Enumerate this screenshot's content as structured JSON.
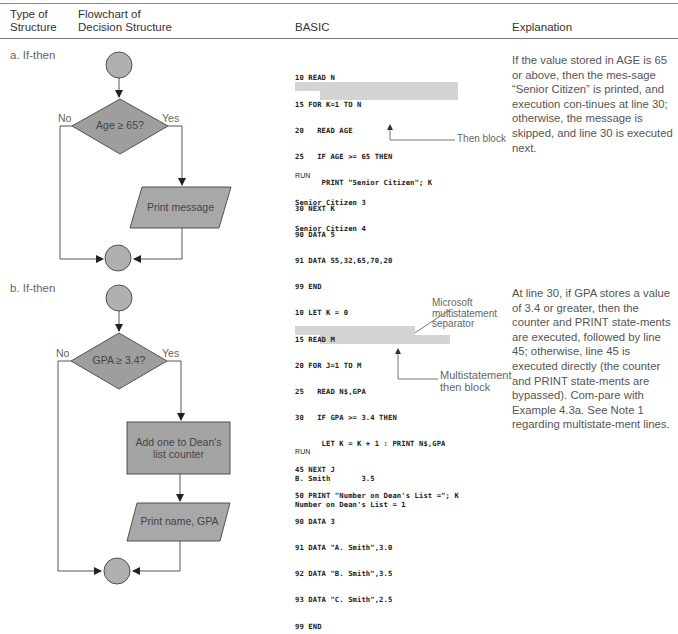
{
  "headers": {
    "type_of_structure": [
      "Type of",
      "Structure"
    ],
    "flowchart": [
      "Flowchart of",
      "Decision Structure"
    ],
    "basic": "BASIC",
    "explanation": "Explanation"
  },
  "examples": [
    {
      "label": "a.  If-then",
      "flowchart": {
        "decision": "Age ≥ 65?",
        "no": "No",
        "yes": "Yes",
        "io_box": "Print message"
      },
      "code": [
        "10 READ N",
        "15 FOR K=1 TO N",
        "20   READ AGE",
        "25   IF AGE >= 65 THEN",
        "      PRINT \"Senior Citizen\"; K",
        "30 NEXT K",
        "90 DATA 5",
        "91 DATA 55,32,65,70,20",
        "99 END"
      ],
      "annotations": [
        "Then block"
      ],
      "run": [
        "RUN",
        "Senior Citizen 3",
        "Senior Citizen 4"
      ],
      "explanation": "If the value stored in AGE is 65 or above, then the mes-sage “Senior Citizen” is printed, and execution con-tinues at line 30; otherwise, the message is skipped, and line 30 is executed next."
    },
    {
      "label": "b.  If-then",
      "flowchart": {
        "decision": "GPA ≥ 3.4?",
        "no": "No",
        "yes": "Yes",
        "process_box": [
          "Add one to Dean's",
          "list counter"
        ],
        "io_box": "Print name, GPA"
      },
      "code": [
        "10 LET K = 0",
        "15 READ M",
        "20 FOR J=1 TO M",
        "25   READ N$,GPA",
        "30   IF GPA >= 3.4 THEN",
        "      LET K = K + 1 : PRINT N$,GPA",
        "45 NEXT J",
        "50 PRINT \"Number on Dean's List =\"; K",
        "90 DATA 3",
        "91 DATA \"A. Smith\",3.0",
        "92 DATA \"B. Smith\",3.5",
        "93 DATA \"C. Smith\",2.5",
        "99 END"
      ],
      "annotations": [
        "Microsoft",
        "multistatement",
        "separator",
        "Multistatement",
        "then block"
      ],
      "run": [
        "RUN",
        "B. Smith       3.5",
        "Number on Dean's List = 1"
      ],
      "explanation": "At line 30, if GPA stores a value of 3.4 or greater, then the counter and PRINT state-ments are executed, followed by line 45; otherwise, line 45 is executed directly (the counter and PRINT state-ments are bypassed). Com-pare with Example 4.3a. See Note 1 regarding multistate-ment lines."
    }
  ]
}
